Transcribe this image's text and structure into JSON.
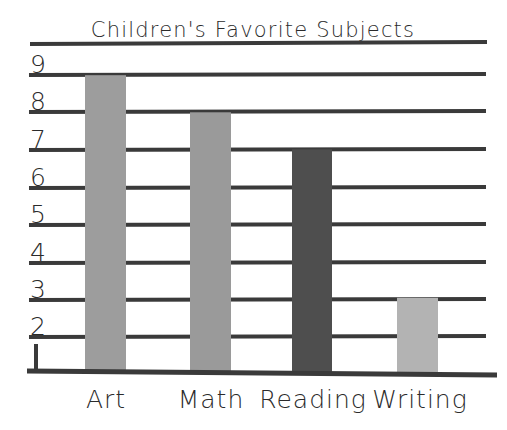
{
  "chart_data": {
    "type": "bar",
    "title": "Children's Favorite Subjects",
    "xlabel": "",
    "ylabel": "",
    "categories": [
      "Art",
      "Math",
      "Reading",
      "Writing"
    ],
    "values": [
      9,
      8,
      7,
      3
    ],
    "ylim": [
      1,
      9
    ],
    "yticks": [
      "9",
      "8",
      "7",
      "6",
      "5",
      "4",
      "3",
      "2",
      "1"
    ],
    "ytick_values": [
      9,
      8,
      7,
      6,
      5,
      4,
      3,
      2,
      1
    ],
    "grid": true,
    "legend": "none",
    "style": "hand-drawn",
    "bar_colors": [
      "#9d9d9d",
      "#9a9a9a",
      "#4e4e4e",
      "#b3b3b3"
    ],
    "series": [
      {
        "name": "Favorite Subject Votes",
        "values": [
          9,
          8,
          7,
          3
        ]
      }
    ]
  },
  "axes": {
    "y_labels": [
      {
        "text": "9",
        "value": 9
      },
      {
        "text": "8",
        "value": 8
      },
      {
        "text": "7",
        "value": 7
      },
      {
        "text": "6",
        "value": 6
      },
      {
        "text": "5",
        "value": 5
      },
      {
        "text": "4",
        "value": 4
      },
      {
        "text": "3",
        "value": 3
      },
      {
        "text": "2",
        "value": 2
      },
      {
        "text": "1",
        "value": 1
      }
    ],
    "x_labels": [
      "Art",
      "Math",
      "Reading",
      "Writing"
    ]
  },
  "colors": {
    "ink": "#3a3a3a",
    "text": "#2b2b2b",
    "background": "#ffffff",
    "bar_art": "#9d9d9d",
    "bar_math": "#9a9a9a",
    "bar_reading": "#4e4e4e",
    "bar_writing": "#b3b3b3"
  }
}
